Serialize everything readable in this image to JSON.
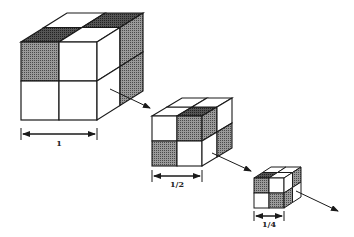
{
  "diagram": {
    "type": "self-similar scaling of 2x2x2 checkered cubes",
    "colors": {
      "line": "#1a1a1a",
      "shade": "#7a7a7a",
      "dark_shade": "#3a3a3a",
      "fill": "#ffffff"
    },
    "cubes": [
      {
        "id": "large",
        "scale_label": "1"
      },
      {
        "id": "medium",
        "scale_label": "1/2"
      },
      {
        "id": "small",
        "scale_label": "1/4"
      }
    ],
    "arrows": [
      "large-to-medium",
      "medium-to-small",
      "small-to-next"
    ]
  }
}
